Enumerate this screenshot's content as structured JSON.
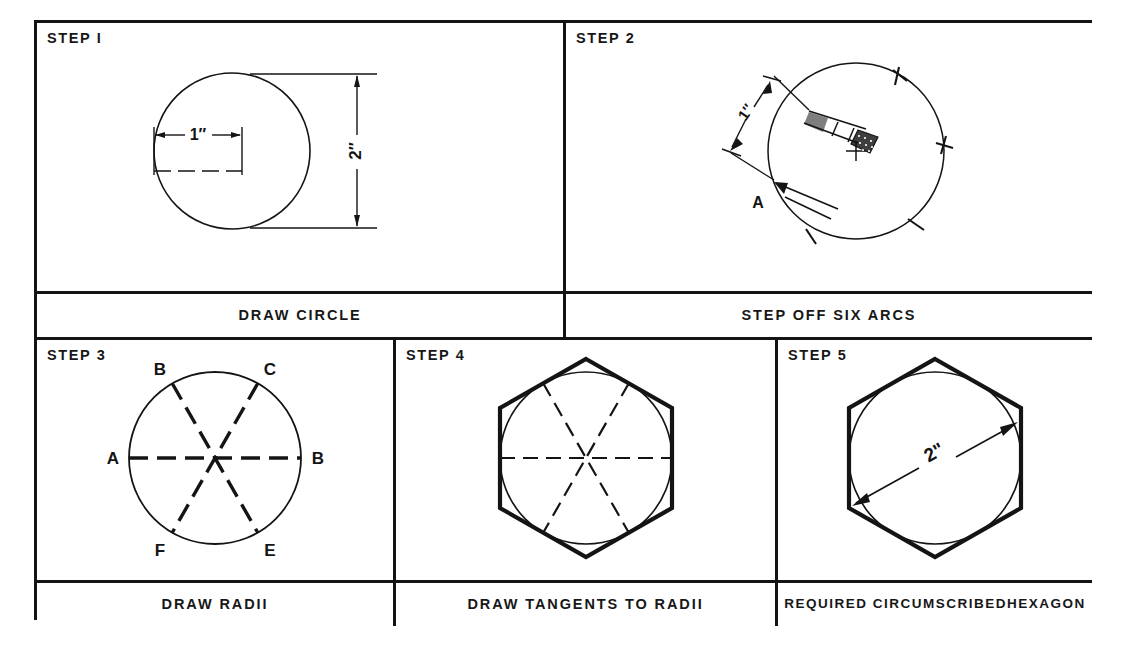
{
  "figure": {
    "type": "technical-drawing-instruction-sheet",
    "panel_count": 5
  },
  "panels": [
    {
      "id": "step-1",
      "step_label": "STEP I",
      "caption": "DRAW CIRCLE",
      "annotations": [
        {
          "name": "radius-dimension",
          "text": "1\"",
          "orientation": "horizontal"
        },
        {
          "name": "diameter-dimension",
          "text": "2\"",
          "orientation": "vertical"
        }
      ],
      "geometry": {
        "shape": "circle",
        "diameter_in": 2,
        "radius_in": 1
      }
    },
    {
      "id": "step-2",
      "step_label": "STEP 2",
      "caption": "STEP OFF SIX ARCS",
      "annotations": [
        {
          "name": "compass-span-dimension",
          "text": "1\"",
          "orientation": "diagonal"
        },
        {
          "name": "start-point-label",
          "text": "A"
        }
      ],
      "geometry": {
        "shape": "circle",
        "arc_count": 6,
        "tool": "compass"
      }
    },
    {
      "id": "step-3",
      "step_label": "STEP 3",
      "caption": "DRAW RADII",
      "annotations": [
        {
          "name": "vertex-label-a",
          "text": "A"
        },
        {
          "name": "vertex-label-b-top",
          "text": "B"
        },
        {
          "name": "vertex-label-c",
          "text": "C"
        },
        {
          "name": "vertex-label-b-right",
          "text": "B"
        },
        {
          "name": "vertex-label-e",
          "text": "E"
        },
        {
          "name": "vertex-label-f",
          "text": "F"
        }
      ],
      "geometry": {
        "shape": "circle",
        "radii_count": 6,
        "line_style": "dashed"
      }
    },
    {
      "id": "step-4",
      "step_label": "STEP 4",
      "caption": "DRAW TANGENTS TO RADII",
      "annotations": [],
      "geometry": {
        "shape": "hexagon-circumscribed",
        "orientation": "pointy-top",
        "sides": 6
      }
    },
    {
      "id": "step-5",
      "step_label": "STEP 5",
      "caption": "REQUIRED CIRCUMSCRIBED HEXAGON",
      "caption_lines": [
        "REQUIRED CIRCUMSCRIBED",
        "HEXAGON"
      ],
      "annotations": [
        {
          "name": "across-flats-dimension",
          "text": "2\"",
          "orientation": "diagonal"
        }
      ],
      "geometry": {
        "shape": "hexagon-circumscribed",
        "orientation": "pointy-top",
        "sides": 6,
        "across_flats_in": 2
      }
    }
  ],
  "colors": {
    "ink": "#141414",
    "paper": "#ffffff"
  }
}
